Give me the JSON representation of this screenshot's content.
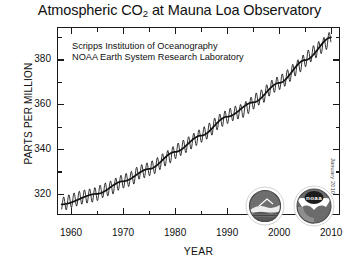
{
  "chart_data": {
    "type": "line",
    "title": "Atmospheric CO2 at Mauna Loa Observatory",
    "title_main_before": "Atmospheric CO",
    "title_sub": "2",
    "title_main_after": " at Mauna Loa Observatory",
    "xlabel": "YEAR",
    "ylabel": "PARTS PER MILLION",
    "xlim": [
      1957.5,
      2011.5
    ],
    "ylim": [
      311,
      394
    ],
    "xticks": [
      1960,
      1970,
      1980,
      1990,
      2000,
      2010
    ],
    "xtick_labels": [
      "1960",
      "1970",
      "1980",
      "1990",
      "2000",
      "2010"
    ],
    "xminor_ticks": [
      1965,
      1975,
      1985,
      1995,
      2005
    ],
    "yticks": [
      320,
      340,
      360,
      380
    ],
    "ytick_labels": [
      "320",
      "340",
      "360",
      "380"
    ],
    "yminor_ticks": [
      330,
      350,
      370,
      390
    ],
    "grid": false,
    "legend": "none",
    "annotations": [
      "Scripps Institution of Oceanography",
      "NOAA Earth System Research Laboratory"
    ],
    "credit": "January 2010",
    "series": [
      {
        "name": "Monthly mean CO2 (seasonal cycle)",
        "color": "#111111",
        "seasonal_amplitude_ppm": 3.1,
        "x": [
          1958.2,
          1959,
          1960,
          1961,
          1962,
          1963,
          1964,
          1965,
          1966,
          1967,
          1968,
          1969,
          1970,
          1971,
          1972,
          1973,
          1974,
          1975,
          1976,
          1977,
          1978,
          1979,
          1980,
          1981,
          1982,
          1983,
          1984,
          1985,
          1986,
          1987,
          1988,
          1989,
          1990,
          1991,
          1992,
          1993,
          1994,
          1995,
          1996,
          1997,
          1998,
          1999,
          2000,
          2001,
          2002,
          2003,
          2004,
          2005,
          2006,
          2007,
          2008,
          2009,
          2010
        ],
        "values": [
          315.3,
          315.9,
          316.9,
          317.6,
          318.4,
          318.9,
          319.3,
          320.0,
          321.3,
          322.1,
          323.0,
          324.6,
          325.6,
          326.3,
          327.4,
          329.6,
          330.2,
          331.1,
          332.0,
          333.8,
          335.4,
          336.8,
          338.7,
          340.1,
          341.4,
          343.0,
          344.6,
          346.0,
          347.4,
          349.2,
          351.6,
          353.1,
          354.4,
          355.6,
          356.4,
          357.1,
          358.8,
          360.8,
          362.6,
          363.8,
          366.6,
          368.3,
          369.5,
          371.0,
          373.1,
          375.6,
          377.4,
          379.7,
          381.9,
          383.7,
          385.6,
          387.4,
          389.8
        ]
      },
      {
        "name": "Trend (seasonally adjusted)",
        "color": "#111111",
        "x": [
          1958.2,
          1965,
          1970,
          1975,
          1980,
          1985,
          1990,
          1995,
          2000,
          2005,
          2010
        ],
        "values": [
          315.3,
          320.0,
          325.6,
          331.1,
          338.7,
          346.0,
          354.4,
          360.8,
          369.5,
          379.7,
          389.8
        ]
      }
    ]
  },
  "logos": [
    {
      "name": "scripps-logo",
      "label": "Scripps Institution of Oceanography"
    },
    {
      "name": "noaa-logo",
      "label": "noaa"
    }
  ]
}
